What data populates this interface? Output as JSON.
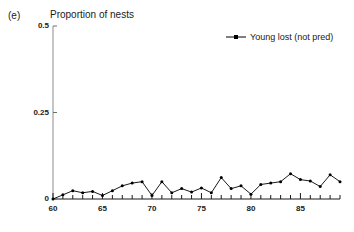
{
  "panel": {
    "label": "(e)"
  },
  "legend": {
    "position": "top-right",
    "entries": [
      {
        "name": "Young lost (not pred)",
        "marker": "line-with-dot-icon",
        "color": "#000000"
      }
    ]
  },
  "axes": {
    "y_title": "Proportion of nests",
    "y_ticks": [
      "0.5",
      "0.25",
      "0"
    ],
    "x_ticks": [
      "60",
      "65",
      "70",
      "75",
      "80",
      "85"
    ]
  },
  "chart_data": {
    "type": "line",
    "title": "Proportion of nests",
    "subtitle": "(e)",
    "xlabel": "",
    "ylabel": "Proportion of nests",
    "xlim": [
      60,
      89
    ],
    "ylim": [
      0,
      0.5
    ],
    "yticks": [
      0,
      0.25,
      0.5
    ],
    "ytick_labels": [
      "0",
      "0.25",
      "0.5"
    ],
    "xticks": [
      60,
      65,
      70,
      75,
      80,
      85
    ],
    "xtick_labels": [
      "60",
      "65",
      "70",
      "75",
      "80",
      "85"
    ],
    "xminor_tick_step": 1,
    "grid": false,
    "legend_position": "top-right",
    "marker": "filled-circle",
    "line_color": "#000000",
    "x": [
      60,
      61,
      62,
      63,
      64,
      65,
      66,
      67,
      68,
      69,
      70,
      71,
      72,
      73,
      74,
      75,
      76,
      77,
      78,
      79,
      80,
      81,
      82,
      83,
      84,
      85,
      86,
      87,
      88,
      89
    ],
    "series": [
      {
        "name": "Young lost (not pred)",
        "color": "#000000",
        "values": [
          0.0,
          0.012,
          0.024,
          0.018,
          0.022,
          0.01,
          0.024,
          0.038,
          0.046,
          0.05,
          0.01,
          0.05,
          0.018,
          0.03,
          0.02,
          0.032,
          0.018,
          0.062,
          0.03,
          0.038,
          0.014,
          0.042,
          0.046,
          0.05,
          0.073,
          0.056,
          0.052,
          0.036,
          0.07,
          0.05
        ]
      }
    ]
  }
}
